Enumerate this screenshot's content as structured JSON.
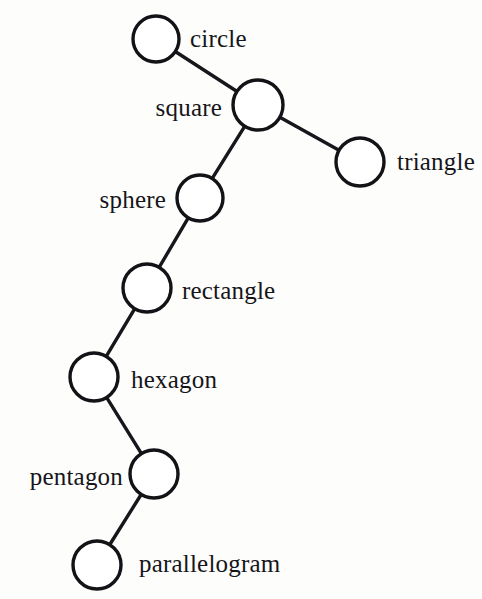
{
  "figure": {
    "type": "node-link-graph",
    "background_color": "#fdfdfc",
    "node_fill_color": "#ffffff",
    "node_stroke_color": "#131216",
    "edge_color": "#17161a",
    "label_color": "#16151a",
    "top_cut_text": ""
  },
  "chart_data": {
    "type": "diagram",
    "title": "",
    "xlabel": "",
    "ylabel": "",
    "nodes": [
      {
        "id": "circle",
        "label": "circle",
        "cx": 156,
        "cy": 39,
        "r": 23,
        "label_side": "right",
        "label_x": 190,
        "label_y": 38
      },
      {
        "id": "square",
        "label": "square",
        "cx": 258,
        "cy": 105,
        "r": 25,
        "label_side": "left",
        "label_x": 222,
        "label_y": 107
      },
      {
        "id": "triangle",
        "label": "triangle",
        "cx": 360,
        "cy": 162,
        "r": 24,
        "label_side": "right",
        "label_x": 397,
        "label_y": 161
      },
      {
        "id": "sphere",
        "label": "sphere",
        "cx": 200,
        "cy": 198,
        "r": 23,
        "label_side": "left",
        "label_x": 166,
        "label_y": 199
      },
      {
        "id": "rectangle",
        "label": "rectangle",
        "cx": 147,
        "cy": 288,
        "r": 24,
        "label_side": "right",
        "label_x": 182,
        "label_y": 290
      },
      {
        "id": "hexagon",
        "label": "hexagon",
        "cx": 94,
        "cy": 377,
        "r": 24,
        "label_side": "right",
        "label_x": 131,
        "label_y": 379
      },
      {
        "id": "pentagon",
        "label": "pentagon",
        "cx": 154,
        "cy": 474,
        "r": 24,
        "label_side": "left",
        "label_x": 123,
        "label_y": 476
      },
      {
        "id": "parallelogram",
        "label": "parallelogram",
        "cx": 97,
        "cy": 565,
        "r": 24,
        "label_side": "right",
        "label_x": 139,
        "label_y": 563
      }
    ],
    "edges": [
      {
        "source": "circle",
        "target": "square"
      },
      {
        "source": "square",
        "target": "triangle"
      },
      {
        "source": "square",
        "target": "sphere"
      },
      {
        "source": "sphere",
        "target": "rectangle"
      },
      {
        "source": "rectangle",
        "target": "hexagon"
      },
      {
        "source": "hexagon",
        "target": "pentagon"
      },
      {
        "source": "pentagon",
        "target": "parallelogram"
      }
    ],
    "legend": [],
    "annotations": []
  }
}
